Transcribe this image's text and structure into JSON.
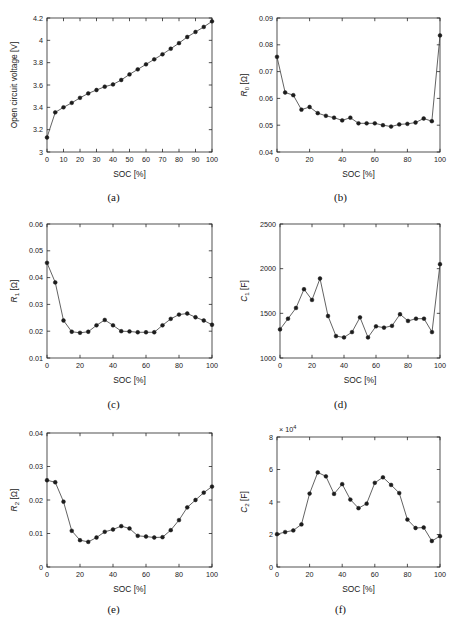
{
  "figure": {
    "xlabel": "SOC [%]",
    "captions": {
      "a": "(a)",
      "b": "(b)",
      "c": "(c)",
      "d": "(d)",
      "e": "(e)",
      "f": "(f)"
    }
  },
  "chart_data": [
    {
      "id": "a",
      "type": "line",
      "title": "",
      "xlabel": "SOC [%]",
      "ylabel": "Open circuit voltage [V]",
      "ylabel_html": "Open circuit voltage [V]",
      "xlim": [
        0,
        100
      ],
      "ylim": [
        3,
        4.2
      ],
      "xticks": [
        0,
        10,
        20,
        30,
        40,
        50,
        60,
        70,
        80,
        90,
        100
      ],
      "xticklabels": [
        "0",
        "10",
        "20",
        "30",
        "40",
        "50",
        "60",
        "70",
        "80",
        "90",
        "100"
      ],
      "yticks": [
        3,
        3.2,
        3.4,
        3.6,
        3.8,
        4,
        4.2
      ],
      "yticklabels": [
        "3",
        "3.2",
        "3.4",
        "3.6",
        "3.8",
        "4",
        "4.2"
      ],
      "grid": false,
      "legend": null,
      "x": [
        0,
        5,
        10,
        15,
        20,
        25,
        30,
        35,
        40,
        45,
        50,
        55,
        60,
        65,
        70,
        75,
        80,
        85,
        90,
        95,
        100
      ],
      "values": [
        3.13,
        3.355,
        3.4,
        3.44,
        3.485,
        3.525,
        3.555,
        3.585,
        3.605,
        3.645,
        3.695,
        3.74,
        3.785,
        3.83,
        3.875,
        3.925,
        3.975,
        4.03,
        4.075,
        4.12,
        4.17
      ]
    },
    {
      "id": "b",
      "type": "line",
      "title": "",
      "xlabel": "SOC [%]",
      "ylabel": "R0 [Ω]",
      "ylabel_base": "R",
      "ylabel_sub": "0",
      "ylabel_unit": " [Ω]",
      "xlim": [
        0,
        100
      ],
      "ylim": [
        0.04,
        0.09
      ],
      "xticks": [
        0,
        20,
        40,
        60,
        80,
        100
      ],
      "xticklabels": [
        "0",
        "20",
        "40",
        "60",
        "80",
        "100"
      ],
      "yticks": [
        0.04,
        0.05,
        0.06,
        0.07,
        0.08,
        0.09
      ],
      "yticklabels": [
        "0.04",
        "0.05",
        "0.06",
        "0.07",
        "0.08",
        "0.09"
      ],
      "grid": false,
      "legend": null,
      "x": [
        0,
        5,
        10,
        15,
        20,
        25,
        30,
        35,
        40,
        45,
        50,
        55,
        60,
        65,
        70,
        75,
        80,
        85,
        90,
        95,
        100
      ],
      "values": [
        0.0755,
        0.0622,
        0.0612,
        0.0558,
        0.0568,
        0.0545,
        0.0535,
        0.0528,
        0.0518,
        0.0528,
        0.0507,
        0.0507,
        0.0507,
        0.05,
        0.0495,
        0.0503,
        0.0505,
        0.051,
        0.0525,
        0.0515,
        0.0835
      ]
    },
    {
      "id": "c",
      "type": "line",
      "title": "",
      "xlabel": "SOC [%]",
      "ylabel": "R1 [Ω]",
      "ylabel_base": "R",
      "ylabel_sub": "1",
      "ylabel_unit": " [Ω]",
      "xlim": [
        0,
        100
      ],
      "ylim": [
        0.01,
        0.06
      ],
      "xticks": [
        0,
        20,
        40,
        60,
        80,
        100
      ],
      "xticklabels": [
        "0",
        "20",
        "40",
        "60",
        "80",
        "100"
      ],
      "yticks": [
        0.01,
        0.02,
        0.03,
        0.04,
        0.05,
        0.06
      ],
      "yticklabels": [
        "0.01",
        "0.02",
        "0.03",
        "0.04",
        "0.05",
        "0.06"
      ],
      "grid": false,
      "legend": null,
      "x": [
        0,
        5,
        10,
        15,
        20,
        25,
        30,
        35,
        40,
        45,
        50,
        55,
        60,
        65,
        70,
        75,
        80,
        85,
        90,
        95,
        100
      ],
      "values": [
        0.0455,
        0.0382,
        0.024,
        0.0198,
        0.0194,
        0.0198,
        0.0222,
        0.0242,
        0.0222,
        0.02,
        0.0199,
        0.0196,
        0.0196,
        0.0196,
        0.0222,
        0.0246,
        0.0262,
        0.0266,
        0.0252,
        0.024,
        0.0224
      ]
    },
    {
      "id": "d",
      "type": "line",
      "title": "",
      "xlabel": "SOC [%]",
      "ylabel": "C1 [F]",
      "ylabel_base": "C",
      "ylabel_sub": "1",
      "ylabel_unit": " [F]",
      "xlim": [
        0,
        100
      ],
      "ylim": [
        1000,
        2500
      ],
      "xticks": [
        0,
        20,
        40,
        60,
        80,
        100
      ],
      "xticklabels": [
        "0",
        "20",
        "40",
        "60",
        "80",
        "100"
      ],
      "yticks": [
        1000,
        1500,
        2000,
        2500
      ],
      "yticklabels": [
        "1000",
        "1500",
        "2000",
        "2500"
      ],
      "grid": false,
      "legend": null,
      "x": [
        0,
        5,
        10,
        15,
        20,
        25,
        30,
        35,
        40,
        45,
        50,
        55,
        60,
        65,
        70,
        75,
        80,
        85,
        90,
        95,
        100
      ],
      "values": [
        1320,
        1440,
        1560,
        1770,
        1650,
        1890,
        1470,
        1245,
        1230,
        1290,
        1455,
        1230,
        1355,
        1340,
        1360,
        1490,
        1415,
        1440,
        1440,
        1290,
        2050
      ]
    },
    {
      "id": "e",
      "type": "line",
      "title": "",
      "xlabel": "SOC [%]",
      "ylabel": "R2 [Ω]",
      "ylabel_base": "R",
      "ylabel_sub": "2",
      "ylabel_unit": " [Ω]",
      "xlim": [
        0,
        100
      ],
      "ylim": [
        0,
        0.04
      ],
      "xticks": [
        0,
        20,
        40,
        60,
        80,
        100
      ],
      "xticklabels": [
        "0",
        "20",
        "40",
        "60",
        "80",
        "100"
      ],
      "yticks": [
        0,
        0.01,
        0.02,
        0.03,
        0.04
      ],
      "yticklabels": [
        "0",
        "0.01",
        "0.02",
        "0.03",
        "0.04"
      ],
      "grid": false,
      "legend": null,
      "x": [
        0,
        5,
        10,
        15,
        20,
        25,
        30,
        35,
        40,
        45,
        50,
        55,
        60,
        65,
        70,
        75,
        80,
        85,
        90,
        95,
        100
      ],
      "values": [
        0.0259,
        0.0253,
        0.0195,
        0.0108,
        0.008,
        0.0075,
        0.0088,
        0.0105,
        0.0112,
        0.0122,
        0.0115,
        0.0093,
        0.0091,
        0.0088,
        0.0089,
        0.011,
        0.014,
        0.0178,
        0.02,
        0.0222,
        0.024
      ]
    },
    {
      "id": "f",
      "type": "line",
      "title": "",
      "xlabel": "SOC [%]",
      "ylabel": "C2 [F]",
      "ylabel_base": "C",
      "ylabel_sub": "2",
      "ylabel_unit": " [F]",
      "exponent_label": "× 10",
      "exponent_value": "4",
      "xlim": [
        0,
        100
      ],
      "ylim": [
        0,
        8
      ],
      "xticks": [
        0,
        20,
        40,
        60,
        80,
        100
      ],
      "xticklabels": [
        "0",
        "20",
        "40",
        "60",
        "80",
        "100"
      ],
      "yticks": [
        0,
        2,
        4,
        6,
        8
      ],
      "yticklabels": [
        "0",
        "2",
        "4",
        "6",
        "8"
      ],
      "grid": false,
      "legend": null,
      "units_note": "values in 1e4 F",
      "x": [
        0,
        5,
        10,
        15,
        20,
        25,
        30,
        35,
        40,
        45,
        50,
        55,
        60,
        65,
        70,
        75,
        80,
        85,
        90,
        95,
        100
      ],
      "values": [
        2.02,
        2.15,
        2.25,
        2.62,
        4.52,
        5.82,
        5.58,
        4.5,
        5.1,
        4.15,
        3.62,
        3.9,
        5.18,
        5.52,
        5.05,
        4.55,
        2.92,
        2.4,
        2.43,
        1.6,
        1.9
      ]
    }
  ]
}
